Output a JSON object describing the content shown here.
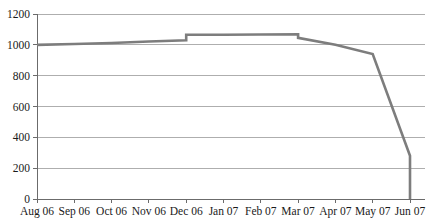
{
  "chart_data": {
    "type": "line",
    "title": "",
    "xlabel": "",
    "ylabel": "",
    "ylim": [
      0,
      1200
    ],
    "ytick_step": 200,
    "grid": true,
    "legend": false,
    "legend_position": "none",
    "line_color": "#7d7d7d",
    "categories": [
      "Aug 06",
      "Sep 06",
      "Oct 06",
      "Nov 06",
      "Dec 06",
      "Jan 07",
      "Feb 07",
      "Mar 07",
      "Apr 07",
      "May 07",
      "Jun 07"
    ],
    "ytick_labels": [
      "0",
      "200",
      "400",
      "600",
      "800",
      "1000",
      "1200"
    ],
    "ytick_values": [
      0,
      200,
      400,
      600,
      800,
      1000,
      1200
    ],
    "series": [
      {
        "name": "value",
        "points": [
          {
            "x": "Aug 06",
            "y": 1000
          },
          {
            "x": "Sep 06",
            "y": 1005
          },
          {
            "x": "Oct 06",
            "y": 1012
          },
          {
            "x": "Nov 06",
            "y": 1022
          },
          {
            "x": "Dec 06",
            "y": 1030
          },
          {
            "x": "Dec 06",
            "y": 1065
          },
          {
            "x": "Jan 07",
            "y": 1065
          },
          {
            "x": "Feb 07",
            "y": 1067
          },
          {
            "x": "Mar 07",
            "y": 1068
          },
          {
            "x": "Mar 07",
            "y": 1045
          },
          {
            "x": "Apr 07",
            "y": 1000
          },
          {
            "x": "May 07",
            "y": 940
          },
          {
            "x": "Jun 07",
            "y": 280
          },
          {
            "x": "Jun 07",
            "y": 0
          }
        ]
      }
    ],
    "annotations": []
  },
  "geometry": {
    "plot_left": 37,
    "plot_right": 425,
    "plot_top": 14,
    "plot_bottom": 199,
    "category_step": 37.3
  }
}
